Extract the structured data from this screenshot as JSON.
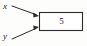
{
  "figure": {
    "type": "block-diagram",
    "background_color": "#fdfdfc",
    "stroke_color": "#2b2b2b",
    "text_color": "#1a1a1a"
  },
  "inputs": [
    {
      "id": "x",
      "label": "x",
      "arrow_from": [
        12,
        6
      ],
      "arrow_to": [
        39,
        16
      ]
    },
    {
      "id": "y",
      "label": "y",
      "arrow_from": [
        12,
        39
      ],
      "arrow_to": [
        39,
        27
      ]
    }
  ],
  "block": {
    "label": "5",
    "shape": "rectangle",
    "x": 39,
    "y": 12,
    "width": 44,
    "height": 19
  }
}
